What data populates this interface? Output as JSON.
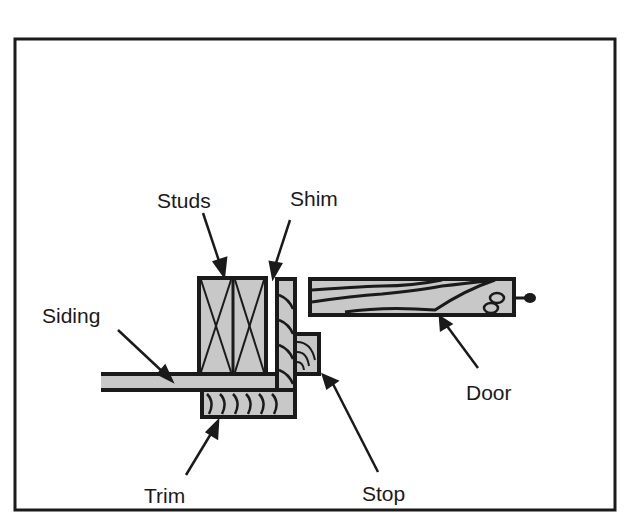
{
  "diagram": {
    "type": "cross-section",
    "colors": {
      "ink": "#1a1a1a",
      "wood_fill": "#c8c8c8",
      "background": "#ffffff"
    },
    "labels": {
      "studs": "Studs",
      "shim": "Shim",
      "siding": "Siding",
      "door": "Door",
      "trim": "Trim",
      "stop": "Stop"
    }
  }
}
